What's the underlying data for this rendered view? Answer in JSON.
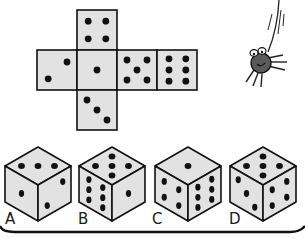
{
  "puzzle": {
    "description": "Unfolded die net: which folded die matches?",
    "net": {
      "top": 4,
      "left": 2,
      "center": 1,
      "right": 5,
      "far_right": 6,
      "bottom": 3
    },
    "options": [
      {
        "label": "A",
        "top": 3,
        "left": 1,
        "right": 2
      },
      {
        "label": "B",
        "top": 5,
        "left": 6,
        "right": 1
      },
      {
        "label": "C",
        "top": 1,
        "left": 4,
        "right": 6
      },
      {
        "label": "D",
        "top": 5,
        "left": 3,
        "right": 4
      }
    ]
  },
  "colors": {
    "face_fill": "#e2e2e2",
    "stroke": "#111111",
    "pip": "#111111",
    "spider_body": "#5a5a5a"
  },
  "decor": {
    "spider": "spider-icon"
  }
}
